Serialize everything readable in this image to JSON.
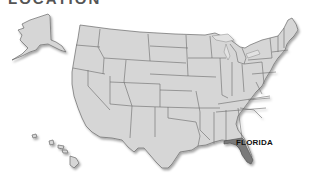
{
  "heading": "LOCATION",
  "map": {
    "type": "US states map",
    "highlighted_state": {
      "name": "FLORIDA",
      "label": "FLORIDA",
      "color": "#7a7a7a"
    },
    "base_state_color": "#d6d6d6",
    "border_color": "#6a6a6a",
    "insets": [
      "Alaska",
      "Hawaii"
    ]
  }
}
